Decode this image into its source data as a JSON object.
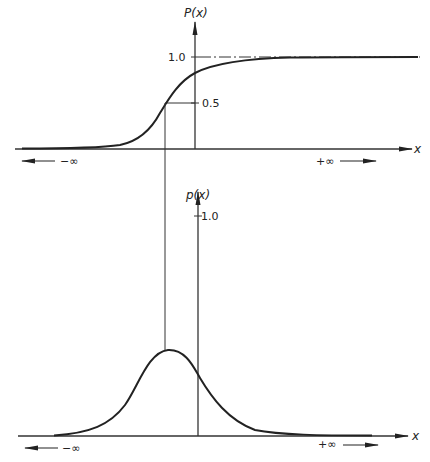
{
  "colors": {
    "background": "#ffffff",
    "ink": "#222222",
    "axis": "#333333"
  },
  "upper_plot": {
    "y_axis_label": "P(x)",
    "x_axis_label": "x",
    "tick_1": "1.0",
    "tick_05": "0.5",
    "left_infinity_label": "−∞",
    "right_infinity_label": "+∞",
    "curve": "cumulative distribution (sigmoid)",
    "asymptote_line_style": "dash-dot at 1.0"
  },
  "lower_plot": {
    "y_axis_label": "p(x)",
    "x_axis_label": "x",
    "tick_1": "1.0",
    "left_infinity_label": "−∞",
    "right_infinity_label": "+∞",
    "curve": "probability density (bell curve)"
  },
  "connector": {
    "description": "vertical line from P(x)=0.5 down to peak of p(x)"
  }
}
